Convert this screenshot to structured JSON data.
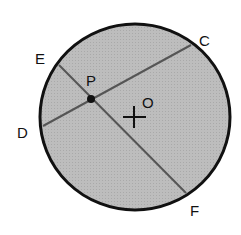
{
  "diagram": {
    "type": "circle-with-intersecting-chords",
    "colors": {
      "background": "#ffffff",
      "circle_fill": "#b8b8b8",
      "circle_stroke": "#111111",
      "chord_stroke": "#555555",
      "text": "#111111"
    },
    "circle": {
      "center_label": "O",
      "cx": 135,
      "cy": 117,
      "r": 94
    },
    "points": {
      "E": {
        "label": "E",
        "x": 59,
        "y": 65
      },
      "F": {
        "label": "F",
        "x": 186,
        "y": 193
      },
      "C": {
        "label": "C",
        "x": 191,
        "y": 45
      },
      "D": {
        "label": "D",
        "x": 43,
        "y": 126
      },
      "P": {
        "label": "P",
        "x": 91,
        "y": 99
      },
      "O": {
        "label": "O",
        "x": 134,
        "y": 117
      }
    },
    "chords": [
      {
        "name": "EF",
        "from": "E",
        "to": "F"
      },
      {
        "name": "CD",
        "from": "C",
        "to": "D"
      }
    ],
    "labels": {
      "E": "E",
      "C": "C",
      "D": "D",
      "F": "F",
      "P": "P",
      "O": "O"
    }
  }
}
